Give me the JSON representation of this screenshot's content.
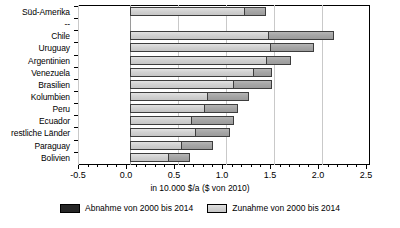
{
  "chart_data": {
    "type": "bar",
    "orientation": "horizontal",
    "title": "",
    "xlabel": "in 10.000 $/a ($ von 2010)",
    "ylabel": "",
    "xlim": [
      -0.5,
      2.5
    ],
    "xticks": [
      -0.5,
      0.0,
      0.5,
      1.0,
      1.5,
      2.0,
      2.5
    ],
    "xticklabels": [
      "-0.5",
      "0.0",
      "0.5",
      "1.0",
      "1.5",
      "2.0",
      "2.5"
    ],
    "minor_tick_step": 0.1,
    "grid": true,
    "grid_axis": "x",
    "legend_position": "bottom",
    "categories": [
      "Süd-Amerika",
      "--",
      "Chile",
      "Uruguay",
      "Argentinien",
      "Venezuela",
      "Brasilien",
      "Kolumbien",
      "Peru",
      "Ecuador",
      "restliche Länder",
      "Paraguay",
      "Bolivien"
    ],
    "series": [
      {
        "name": "Wert 2000",
        "color": "#d2d2d2",
        "values": [
          1.19,
          null,
          1.44,
          1.46,
          1.42,
          1.28,
          1.07,
          0.8,
          0.77,
          0.64,
          0.68,
          0.53,
          0.4
        ]
      },
      {
        "name": "Zuwachs bis 2014",
        "color": "#a6a6a6",
        "values": [
          0.23,
          null,
          0.68,
          0.46,
          0.26,
          0.2,
          0.41,
          0.44,
          0.35,
          0.44,
          0.36,
          0.33,
          0.23
        ]
      }
    ],
    "totals_2014": [
      1.42,
      null,
      2.12,
      1.92,
      1.68,
      1.48,
      1.48,
      1.24,
      1.12,
      1.08,
      1.04,
      0.86,
      0.63
    ],
    "legend": [
      {
        "label": "Abnahme von 2000 bis 2014",
        "color": "#262626",
        "key": "abnahme"
      },
      {
        "label": "Zunahme von 2000 bis 2014",
        "color": "#d2d2d2",
        "key": "zunahme"
      }
    ]
  }
}
